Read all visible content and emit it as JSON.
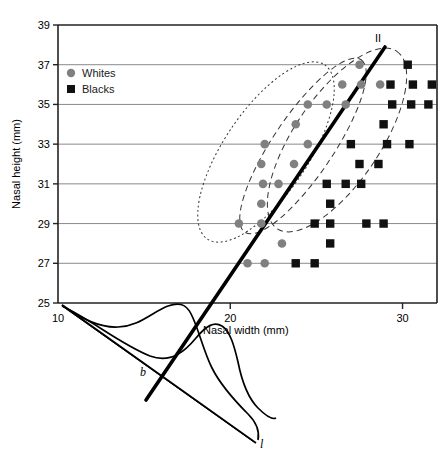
{
  "chart_data": {
    "type": "scatter",
    "title": "",
    "xlabel": "Nasal width (mm)",
    "ylabel": "Nasal height (mm)",
    "xlim": [
      10,
      32
    ],
    "ylim": [
      25,
      39
    ],
    "xticks": [
      10,
      20,
      30
    ],
    "yticks": [
      25,
      27,
      29,
      31,
      33,
      35,
      37,
      39
    ],
    "xtick_labels": [
      "10",
      "20",
      "30"
    ],
    "ytick_labels": [
      "25",
      "27",
      "29",
      "31",
      "33",
      "35",
      "37",
      "39"
    ],
    "grid": "horizontal",
    "legend_position": "top-left-inside",
    "series": [
      {
        "name": "Whites",
        "marker": "circle",
        "color": "#808080",
        "points": [
          [
            21.0,
            27.0
          ],
          [
            22.0,
            27.0
          ],
          [
            23.0,
            28.0
          ],
          [
            20.5,
            29.0
          ],
          [
            21.8,
            29.0
          ],
          [
            21.8,
            30.0
          ],
          [
            21.9,
            31.0
          ],
          [
            22.8,
            31.0
          ],
          [
            21.8,
            32.0
          ],
          [
            23.7,
            32.0
          ],
          [
            22.0,
            33.0
          ],
          [
            24.5,
            33.0
          ],
          [
            23.8,
            34.0
          ],
          [
            24.5,
            35.0
          ],
          [
            25.6,
            35.0
          ],
          [
            26.7,
            35.0
          ],
          [
            26.5,
            36.0
          ],
          [
            27.6,
            36.0
          ],
          [
            28.7,
            36.0
          ],
          [
            27.5,
            37.0
          ]
        ]
      },
      {
        "name": "Blacks",
        "marker": "square",
        "color": "#111111",
        "points": [
          [
            23.8,
            27.0
          ],
          [
            24.9,
            27.0
          ],
          [
            25.8,
            28.0
          ],
          [
            24.9,
            29.0
          ],
          [
            25.8,
            29.0
          ],
          [
            27.9,
            29.0
          ],
          [
            28.9,
            29.0
          ],
          [
            25.8,
            30.0
          ],
          [
            25.6,
            31.0
          ],
          [
            26.7,
            31.0
          ],
          [
            27.6,
            31.0
          ],
          [
            27.5,
            32.0
          ],
          [
            28.6,
            32.0
          ],
          [
            27.0,
            33.0
          ],
          [
            29.1,
            33.0
          ],
          [
            30.4,
            33.0
          ],
          [
            28.9,
            34.0
          ],
          [
            29.4,
            35.0
          ],
          [
            30.5,
            35.0
          ],
          [
            31.5,
            35.0
          ],
          [
            29.3,
            36.0
          ],
          [
            30.6,
            36.0
          ],
          [
            31.7,
            36.0
          ],
          [
            30.3,
            37.0
          ]
        ]
      }
    ],
    "annotations": [
      {
        "text": "II",
        "x": 30.0,
        "y": 38.4,
        "kind": "roman-numeral"
      },
      {
        "text": "b",
        "x": 17.0,
        "y": 22.0,
        "kind": "italic-axis-label"
      },
      {
        "text": "l",
        "x": 25.5,
        "y": 16.0,
        "kind": "italic-axis-label"
      }
    ],
    "overlays": {
      "discriminant_line": {
        "style": "solid-thick",
        "description": "heavy line from lower-left through cloud to upper-right"
      },
      "ellipses": [
        {
          "style": "dotted",
          "group": "Whites"
        },
        {
          "style": "dashed",
          "group": "Blacks"
        },
        {
          "style": "dashed",
          "group": "combined"
        }
      ],
      "density_curves": {
        "count": 2,
        "description": "projected distributions below the axis"
      }
    }
  },
  "legend": {
    "items": [
      {
        "label": "Whites",
        "marker": "circle",
        "color": "#808080"
      },
      {
        "label": "Blacks",
        "marker": "square",
        "color": "#111111"
      }
    ]
  },
  "axes": {
    "x_title": "Nasal width (mm)",
    "y_title": "Nasal height (mm)"
  }
}
